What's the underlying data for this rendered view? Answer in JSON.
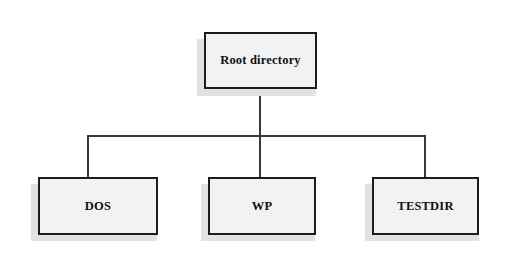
{
  "diagram": {
    "type": "tree",
    "background_color": "#ffffff",
    "node_fill_color": "#f2f2f2",
    "node_border_color": "#1c1c1c",
    "node_shadow_color": "#e2e2e2",
    "connector_color": "#3a3a3a",
    "root": {
      "id": "root-directory",
      "label": "Root directory"
    },
    "children": [
      {
        "id": "dos",
        "label": "DOS"
      },
      {
        "id": "wp",
        "label": "WP"
      },
      {
        "id": "testdir",
        "label": "TESTDIR"
      }
    ]
  }
}
